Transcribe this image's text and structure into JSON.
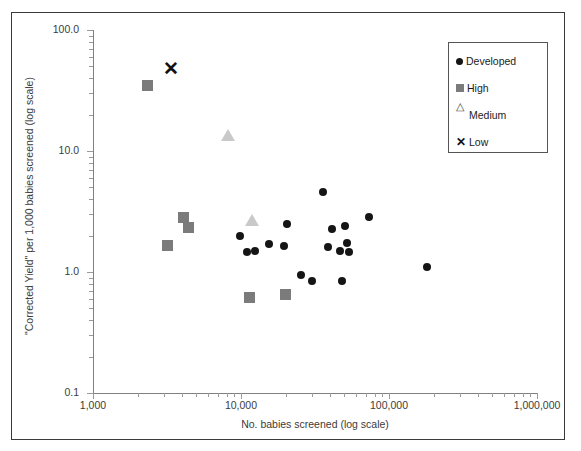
{
  "chart_data": {
    "type": "scatter",
    "title": "",
    "xlabel": "No. babies screened (log scale)",
    "ylabel": "\"Corrected Yield\" per 1,000 babies screened (log scale)",
    "xscale": "log",
    "yscale": "log",
    "xlim": [
      1000,
      1000000
    ],
    "ylim": [
      0.1,
      100.0
    ],
    "grid": false,
    "legend_position": "top-right",
    "x_ticklabels": [
      "1,000",
      "10,000",
      "100,000",
      "1,000,000"
    ],
    "x_tickvalues": [
      1000,
      10000,
      100000,
      1000000
    ],
    "y_ticklabels": [
      "100.0",
      "10.0",
      "1.0",
      "0.1"
    ],
    "y_tickvalues": [
      100.0,
      10.0,
      1.0,
      0.1
    ],
    "series": [
      {
        "name": "Developed",
        "marker": "circle",
        "color": "#151515",
        "points": [
          {
            "x": 9800,
            "y": 2.0
          },
          {
            "x": 12500,
            "y": 1.5
          },
          {
            "x": 15500,
            "y": 1.7
          },
          {
            "x": 11000,
            "y": 1.45
          },
          {
            "x": 19500,
            "y": 1.65
          },
          {
            "x": 20500,
            "y": 2.5
          },
          {
            "x": 25500,
            "y": 0.95
          },
          {
            "x": 30000,
            "y": 0.84
          },
          {
            "x": 36000,
            "y": 4.6
          },
          {
            "x": 41000,
            "y": 2.25
          },
          {
            "x": 38500,
            "y": 1.6
          },
          {
            "x": 47000,
            "y": 1.5
          },
          {
            "x": 50500,
            "y": 2.4
          },
          {
            "x": 52000,
            "y": 1.75
          },
          {
            "x": 54000,
            "y": 1.45
          },
          {
            "x": 48000,
            "y": 0.84
          },
          {
            "x": 73000,
            "y": 2.85
          },
          {
            "x": 180000,
            "y": 1.1
          }
        ]
      },
      {
        "name": "High",
        "marker": "square",
        "color": "#7b7b7b",
        "points": [
          {
            "x": 2350,
            "y": 35.0
          },
          {
            "x": 3200,
            "y": 1.65
          },
          {
            "x": 4100,
            "y": 2.8
          },
          {
            "x": 4450,
            "y": 2.35
          },
          {
            "x": 11500,
            "y": 0.62
          },
          {
            "x": 20000,
            "y": 0.65
          }
        ]
      },
      {
        "name": "Medium",
        "marker": "triangle",
        "color": "#c9c9c9",
        "points": [
          {
            "x": 8200,
            "y": 13.5
          },
          {
            "x": 11800,
            "y": 2.7
          }
        ]
      },
      {
        "name": "Low",
        "marker": "x",
        "color": "#111111",
        "points": [
          {
            "x": 3300,
            "y": 48.0
          }
        ]
      }
    ]
  },
  "legend": {
    "items": [
      {
        "label": "Developed",
        "marker": "circle"
      },
      {
        "label": "High",
        "marker": "square"
      },
      {
        "label": "Medium",
        "marker": "triangle"
      },
      {
        "label": "Low",
        "marker": "x"
      }
    ]
  }
}
